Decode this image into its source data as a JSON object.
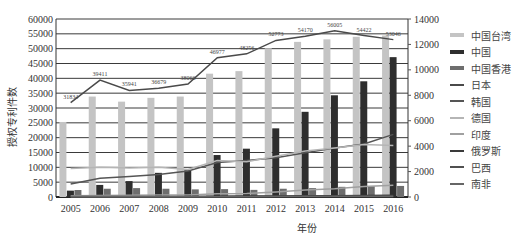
{
  "chart_data": {
    "type": "bar+line",
    "title": "",
    "xlabel": "年份",
    "ylabel_left": "授权专利件数",
    "ylabel_right": "",
    "categories": [
      "2005",
      "2006",
      "2007",
      "2008",
      "2009",
      "2010",
      "2011",
      "2012",
      "2013",
      "2014",
      "2015",
      "2016"
    ],
    "ylim_left": [
      0,
      60000
    ],
    "ylim_right": [
      0,
      14000
    ],
    "yticks_left": [
      "0",
      "5000",
      "10000",
      "15000",
      "20000",
      "25000",
      "30000",
      "35000",
      "40000",
      "45000",
      "50000",
      "55000",
      "60000"
    ],
    "yticks_right": [
      "0",
      "2000",
      "4000",
      "6000",
      "8000",
      "10000",
      "12000",
      "14000"
    ],
    "grid": true,
    "legend_position": "right",
    "series": [
      {
        "name": "中国台湾",
        "kind": "bar",
        "axis": "right",
        "color": "#c4c4c4",
        "values": [
          5900,
          7900,
          7500,
          7800,
          7900,
          9700,
          9900,
          11700,
          12200,
          12400,
          12600,
          12700
        ]
      },
      {
        "name": "中国",
        "kind": "bar",
        "axis": "right",
        "color": "#2e2e2e",
        "values": [
          500,
          950,
          1250,
          1900,
          2100,
          3300,
          3800,
          5400,
          6700,
          8000,
          9100,
          11000
        ]
      },
      {
        "name": "中国香港",
        "kind": "bar",
        "axis": "right",
        "color": "#6e6e6e",
        "values": [
          550,
          650,
          700,
          650,
          600,
          620,
          560,
          650,
          700,
          800,
          850,
          870
        ]
      },
      {
        "name": "日本",
        "kind": "line",
        "axis": "left",
        "color": "#4a4a4a",
        "values": [
          31834,
          39411,
          35941,
          36679,
          38066,
          46977,
          48256,
          52773,
          54170,
          56005,
          54422,
          53046
        ],
        "data_labels": [
          "31834",
          "39411",
          "35941",
          "36679",
          "38066",
          "46977",
          "48256",
          "52773",
          "54170",
          "56005",
          "54422",
          "53046"
        ]
      },
      {
        "name": "韩国",
        "kind": "line",
        "axis": "left",
        "color": "#555555",
        "values": [
          4400,
          6300,
          6900,
          7600,
          8800,
          11600,
          12300,
          13200,
          14900,
          16500,
          17900,
          21100
        ]
      },
      {
        "name": "德国",
        "kind": "line",
        "axis": "left",
        "color": "#b5b5b5",
        "values": [
          9600,
          10000,
          9800,
          10000,
          9300,
          12300,
          11900,
          13700,
          15500,
          16500,
          17700,
          17400
        ]
      },
      {
        "name": "印度",
        "kind": "line",
        "axis": "left",
        "color": "#a0a0a0",
        "values": [
          400,
          500,
          550,
          650,
          700,
          1100,
          1200,
          1700,
          2400,
          2800,
          3500,
          4000
        ]
      },
      {
        "name": "俄罗斯",
        "kind": "line",
        "axis": "left",
        "color": "#3a3a3a",
        "values": [
          150,
          180,
          200,
          200,
          200,
          250,
          300,
          330,
          400,
          450,
          500,
          550
        ]
      },
      {
        "name": "巴西",
        "kind": "line",
        "axis": "left",
        "color": "#505050",
        "values": [
          80,
          100,
          100,
          100,
          110,
          170,
          200,
          200,
          250,
          330,
          330,
          330
        ]
      },
      {
        "name": "南非",
        "kind": "line",
        "axis": "left",
        "color": "#666666",
        "values": [
          90,
          100,
          100,
          90,
          100,
          120,
          120,
          130,
          150,
          150,
          160,
          170
        ]
      }
    ]
  },
  "legend": {
    "items": [
      {
        "label": "中国台湾",
        "color": "#c4c4c4",
        "thick": true
      },
      {
        "label": "中国",
        "color": "#2e2e2e",
        "thick": true
      },
      {
        "label": "中国香港",
        "color": "#6e6e6e",
        "thick": true
      },
      {
        "label": "日本",
        "color": "#4a4a4a",
        "thick": false
      },
      {
        "label": "韩国",
        "color": "#555555",
        "thick": false
      },
      {
        "label": "德国",
        "color": "#b5b5b5",
        "thick": false
      },
      {
        "label": "印度",
        "color": "#a0a0a0",
        "thick": false
      },
      {
        "label": "俄罗斯",
        "color": "#3a3a3a",
        "thick": false
      },
      {
        "label": "巴西",
        "color": "#505050",
        "thick": false
      },
      {
        "label": "南非",
        "color": "#666666",
        "thick": false
      }
    ]
  }
}
